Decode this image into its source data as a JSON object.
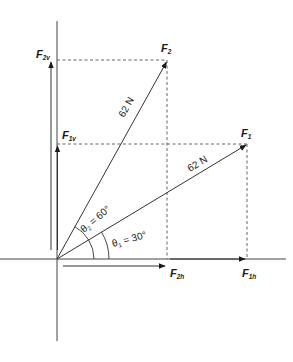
{
  "diagram": {
    "type": "force-vector-decomposition",
    "colors": {
      "line": "#333333",
      "dashed": "#555555",
      "text": "#1a1a1a",
      "background": "#ffffff"
    },
    "vectors": [
      {
        "id": "F1",
        "label": "F",
        "subscript": "1",
        "magnitude_label": "62 N",
        "angle_label": "θ",
        "angle_subscript": "1",
        "angle_value": " = 30°"
      },
      {
        "id": "F2",
        "label": "F",
        "subscript": "2",
        "magnitude_label": "62 N",
        "angle_label": "θ",
        "angle_subscript": "2",
        "angle_value": " = 60°"
      }
    ],
    "components": [
      {
        "id": "F1h",
        "label": "F",
        "subscript": "1h"
      },
      {
        "id": "F1v",
        "label": "F",
        "subscript": "1v"
      },
      {
        "id": "F2h",
        "label": "F",
        "subscript": "2h"
      },
      {
        "id": "F2v",
        "label": "F",
        "subscript": "2v"
      }
    ]
  }
}
